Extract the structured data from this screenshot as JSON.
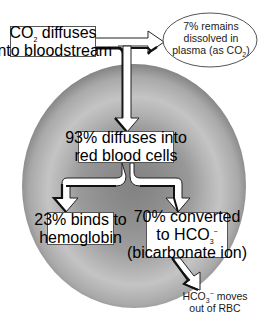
{
  "diagram": {
    "type": "flow",
    "colors": {
      "cell_fill_light": "#c9c9c9",
      "cell_fill_dark": "#6f6f6f",
      "arrow_fill": "#ffffff",
      "arrow_shadow": "#111111",
      "box_border": "#555555",
      "text": "#1a1a1a"
    },
    "nodes": {
      "source": {
        "line1_pre": "CO",
        "line1_sub": "2",
        "line1_post": " diffuses",
        "line2": "into bloodstream"
      },
      "plasma": {
        "line1": "7% remains",
        "line2": "dissolved in",
        "line3_pre": "plasma (as CO",
        "line3_sub": "2",
        "line3_post": ")"
      },
      "rbc": {
        "line1": "93% diffuses into",
        "line2": "red blood cells"
      },
      "hemoglobin": {
        "line1": "23% binds to",
        "line2": "hemoglobin"
      },
      "bicarbonate": {
        "line1": "70% converted",
        "line2_pre": "to HCO",
        "line2_sub": "3",
        "line2_sup": "−",
        "line3": "(bicarbonate ion)"
      },
      "out": {
        "line1_pre": "HCO",
        "line1_sub": "3",
        "line1_sup": "−",
        "line1_post": " moves",
        "line2": "out of RBC"
      }
    },
    "edges": [
      {
        "from": "source",
        "to": "plasma"
      },
      {
        "from": "source",
        "to": "rbc"
      },
      {
        "from": "rbc",
        "to": "hemoglobin"
      },
      {
        "from": "rbc",
        "to": "bicarbonate"
      },
      {
        "from": "bicarbonate",
        "to": "out"
      }
    ]
  }
}
